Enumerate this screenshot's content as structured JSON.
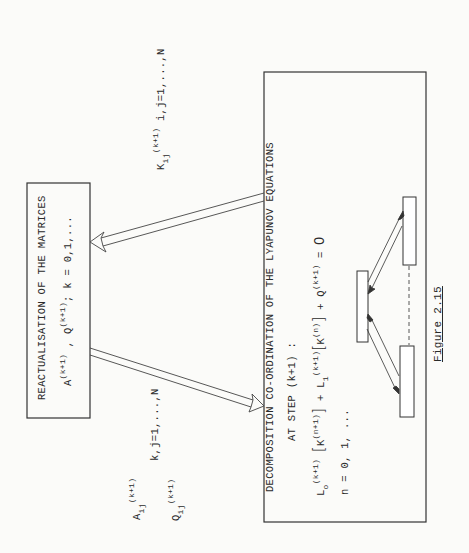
{
  "figure": {
    "caption": "Figure 2.15",
    "orientation": "rotated 90° counter-clockwise"
  },
  "box_reactualisation": {
    "title": "REACTUALISATION OF THE MATRICES",
    "formula": {
      "a": "A",
      "a_sup": "(k+1)",
      "sep": " , ",
      "q": "Q",
      "q_sup": "(k+1)",
      "tail": "; k = 0,1,..."
    }
  },
  "box_decomposition": {
    "title": "DECOMPOSITION CO-ORDINATION OF THE LYAPUNOV EQUATIONS",
    "subtitle": "AT STEP (k+1) :",
    "equation": {
      "l0": "L",
      "l0_sub": "o",
      "l0_sup": "(k+1)",
      "bracket_open": "[",
      "k1": "K",
      "k1_sup": "(n+1)",
      "bracket_close": "]",
      "plus1": " + ",
      "l1": "L",
      "l1_sub": "1",
      "l1_sup": "(k+1)",
      "k2": "K",
      "k2_sup": "(n)",
      "plus2": " + ",
      "q": "Q",
      "q_sup": "(k+1)",
      "equals": " = ",
      "zero": "0"
    },
    "iteration": "n = 0, 1, ..."
  },
  "labels": {
    "k_matrix": {
      "symbol": "K",
      "sub": "ij",
      "sup": "(k+1)",
      "range": "i,j=1,...,N"
    },
    "a_matrix": {
      "symbol": "A",
      "sub": "ij",
      "sup": "(k+1)"
    },
    "a_range": "k,j=1,...,N",
    "q_matrix": {
      "symbol": "Q",
      "sub": "ij",
      "sup": "(k+1)"
    }
  },
  "colors": {
    "ink": "#2a2a2a",
    "paper": "#fbfbf9"
  }
}
